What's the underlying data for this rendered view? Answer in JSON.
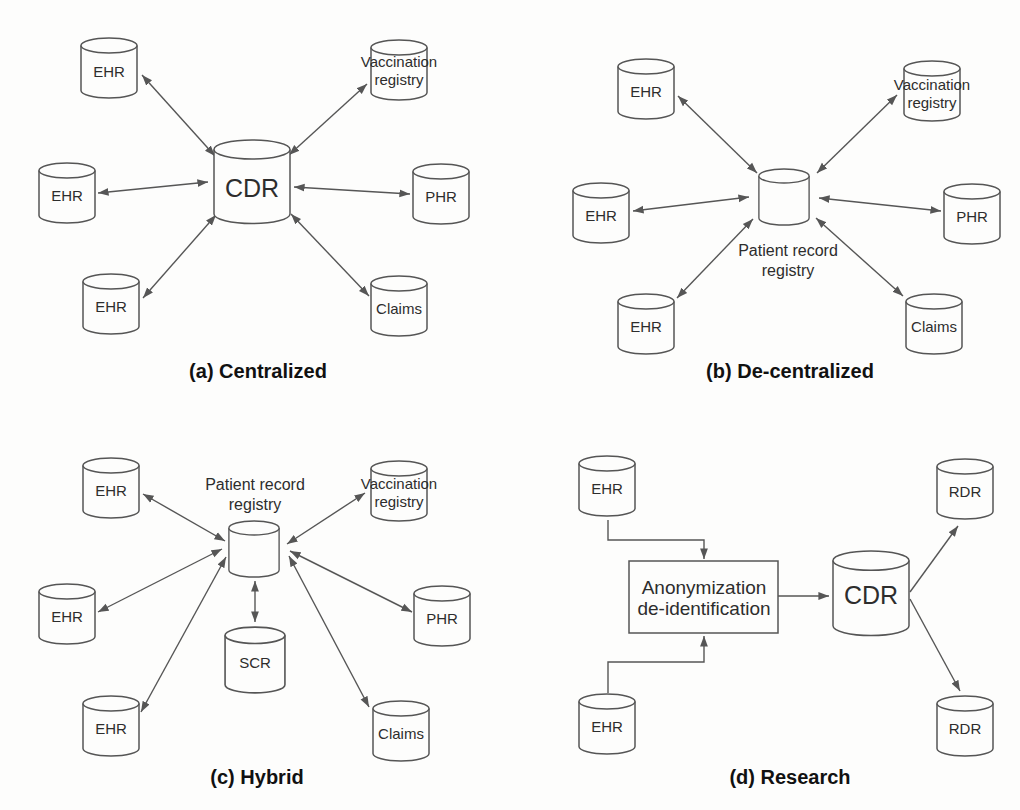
{
  "figure": {
    "type": "diagram",
    "background_color": "#fdfdfc",
    "line_color": "#565656",
    "text_color": "#2d2d2d",
    "caption_color": "#111111"
  },
  "panels": {
    "a": {
      "caption": "(a) Centralized",
      "nodes": {
        "ehr_top_left": {
          "label": "EHR"
        },
        "vaccination_registry": {
          "label_line1": "Vaccination",
          "label_line2": "registry"
        },
        "ehr_mid_left": {
          "label": "EHR"
        },
        "cdr": {
          "label": "CDR"
        },
        "phr": {
          "label": "PHR"
        },
        "ehr_bottom_left": {
          "label": "EHR"
        },
        "claims": {
          "label": "Claims"
        }
      },
      "edges": [
        {
          "from": "ehr_top_left",
          "to": "cdr",
          "type": "bidirectional"
        },
        {
          "from": "vaccination_registry",
          "to": "cdr",
          "type": "bidirectional"
        },
        {
          "from": "ehr_mid_left",
          "to": "cdr",
          "type": "bidirectional"
        },
        {
          "from": "phr",
          "to": "cdr",
          "type": "bidirectional"
        },
        {
          "from": "ehr_bottom_left",
          "to": "cdr",
          "type": "bidirectional"
        },
        {
          "from": "claims",
          "to": "cdr",
          "type": "bidirectional"
        }
      ]
    },
    "b": {
      "caption": "(b) De-centralized",
      "nodes": {
        "ehr_top_left": {
          "label": "EHR"
        },
        "vaccination_registry": {
          "label_line1": "Vaccination",
          "label_line2": "registry"
        },
        "ehr_mid_left": {
          "label": "EHR"
        },
        "patient_record_registry": {
          "label_line1": "Patient record",
          "label_line2": "registry"
        },
        "phr": {
          "label": "PHR"
        },
        "ehr_bottom_left": {
          "label": "EHR"
        },
        "claims": {
          "label": "Claims"
        }
      },
      "edges": [
        {
          "from": "ehr_top_left",
          "to": "patient_record_registry",
          "type": "bidirectional"
        },
        {
          "from": "vaccination_registry",
          "to": "patient_record_registry",
          "type": "bidirectional"
        },
        {
          "from": "ehr_mid_left",
          "to": "patient_record_registry",
          "type": "bidirectional"
        },
        {
          "from": "phr",
          "to": "patient_record_registry",
          "type": "bidirectional"
        },
        {
          "from": "ehr_bottom_left",
          "to": "patient_record_registry",
          "type": "bidirectional"
        },
        {
          "from": "claims",
          "to": "patient_record_registry",
          "type": "bidirectional"
        }
      ]
    },
    "c": {
      "caption": "(c) Hybrid",
      "nodes": {
        "ehr_top_left": {
          "label": "EHR"
        },
        "patient_record_registry": {
          "label_line1": "Patient record",
          "label_line2": "registry"
        },
        "vaccination_registry": {
          "label_line1": "Vaccination",
          "label_line2": "registry"
        },
        "ehr_mid_left": {
          "label": "EHR"
        },
        "phr": {
          "label": "PHR"
        },
        "scr": {
          "label": "SCR"
        },
        "ehr_bottom_left": {
          "label": "EHR"
        },
        "claims": {
          "label": "Claims"
        }
      },
      "edges": [
        {
          "from": "ehr_top_left",
          "to": "patient_record_registry",
          "type": "bidirectional"
        },
        {
          "from": "vaccination_registry",
          "to": "patient_record_registry",
          "type": "bidirectional"
        },
        {
          "from": "ehr_mid_left",
          "to": "patient_record_registry",
          "type": "bidirectional"
        },
        {
          "from": "phr",
          "to": "patient_record_registry",
          "type": "bidirectional"
        },
        {
          "from": "scr",
          "to": "patient_record_registry",
          "type": "bidirectional"
        },
        {
          "from": "ehr_bottom_left",
          "to": "patient_record_registry",
          "type": "bidirectional"
        },
        {
          "from": "claims",
          "to": "patient_record_registry",
          "type": "bidirectional"
        }
      ]
    },
    "d": {
      "caption": "(d) Research",
      "nodes": {
        "ehr_top": {
          "label": "EHR"
        },
        "rdr_top": {
          "label": "RDR"
        },
        "anonymization_box": {
          "label_line1": "Anonymization",
          "label_line2": "de-identification"
        },
        "cdr": {
          "label": "CDR"
        },
        "ehr_bottom": {
          "label": "EHR"
        },
        "rdr_bottom": {
          "label": "RDR"
        }
      },
      "edges": [
        {
          "from": "ehr_top",
          "to": "anonymization_box",
          "type": "directed"
        },
        {
          "from": "ehr_bottom",
          "to": "anonymization_box",
          "type": "directed"
        },
        {
          "from": "anonymization_box",
          "to": "cdr",
          "type": "directed"
        },
        {
          "from": "cdr",
          "to": "rdr_top",
          "type": "directed"
        },
        {
          "from": "cdr",
          "to": "rdr_bottom",
          "type": "directed"
        }
      ]
    }
  }
}
